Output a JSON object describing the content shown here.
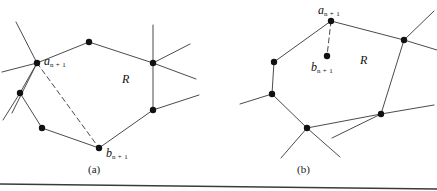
{
  "figure": {
    "background": "#ffffff",
    "edge_color": "#4a4a52",
    "vertex_color": "#111111",
    "label_color": "#111111",
    "rule_color": "#3a3a3a"
  },
  "panels": [
    {
      "id": "a",
      "caption": "(a)",
      "region_label": "R",
      "point_labels": {
        "a": {
          "base": "a",
          "sub": "n + 1"
        },
        "b": {
          "base": "b",
          "sub": "n + 1"
        }
      },
      "vertices": [
        {
          "name": "a-n-plus-1",
          "x": 37,
          "y": 63
        },
        {
          "name": "top",
          "x": 89,
          "y": 42
        },
        {
          "name": "right-upper",
          "x": 153,
          "y": 63
        },
        {
          "name": "right-lower",
          "x": 153,
          "y": 110
        },
        {
          "name": "b-n-plus-1",
          "x": 99,
          "y": 148
        },
        {
          "name": "lower-left-inner",
          "x": 42,
          "y": 128
        },
        {
          "name": "left-mid",
          "x": 20,
          "y": 93
        }
      ],
      "solid_edges": [
        [
          37,
          63,
          89,
          42
        ],
        [
          89,
          42,
          153,
          63
        ],
        [
          153,
          63,
          153,
          110
        ],
        [
          153,
          110,
          99,
          148
        ],
        [
          99,
          148,
          42,
          128
        ],
        [
          42,
          128,
          20,
          93
        ],
        [
          20,
          93,
          37,
          63
        ]
      ],
      "stub_edges": [
        [
          37,
          63,
          16,
          22
        ],
        [
          37,
          63,
          2,
          72
        ],
        [
          37,
          63,
          12,
          113
        ],
        [
          153,
          63,
          190,
          44
        ],
        [
          153,
          63,
          196,
          79
        ],
        [
          153,
          63,
          153,
          25
        ],
        [
          153,
          110,
          199,
          95
        ],
        [
          20,
          93,
          3,
          120
        ]
      ],
      "dashed_edges": [
        [
          37,
          63,
          99,
          148
        ]
      ]
    },
    {
      "id": "b",
      "caption": "(b)",
      "region_label": "R",
      "point_labels": {
        "a": {
          "base": "a",
          "sub": "n + 1"
        },
        "b": {
          "base": "b",
          "sub": "n + 1"
        }
      },
      "vertices": [
        {
          "name": "a-n-plus-1",
          "x": 331,
          "y": 21
        },
        {
          "name": "b-n-plus-1",
          "x": 327,
          "y": 56
        },
        {
          "name": "right-upper",
          "x": 404,
          "y": 40
        },
        {
          "name": "right-lower",
          "x": 381,
          "y": 114
        },
        {
          "name": "bottom",
          "x": 307,
          "y": 128
        },
        {
          "name": "left-lower",
          "x": 272,
          "y": 94
        },
        {
          "name": "left-upper",
          "x": 274,
          "y": 62
        }
      ],
      "solid_edges": [
        [
          331,
          21,
          404,
          40
        ],
        [
          404,
          40,
          381,
          114
        ],
        [
          381,
          114,
          307,
          128
        ],
        [
          307,
          128,
          272,
          94
        ],
        [
          272,
          94,
          274,
          62
        ],
        [
          274,
          62,
          331,
          21
        ]
      ],
      "stub_edges": [
        [
          404,
          40,
          434,
          11
        ],
        [
          404,
          40,
          437,
          50
        ],
        [
          381,
          114,
          434,
          105
        ],
        [
          381,
          114,
          332,
          138
        ],
        [
          307,
          128,
          340,
          157
        ],
        [
          307,
          128,
          281,
          158
        ],
        [
          272,
          94,
          240,
          104
        ]
      ],
      "dashed_edges": [
        [
          331,
          21,
          327,
          56
        ]
      ]
    }
  ],
  "divider": {
    "name": "bottom-rule",
    "x1": 0,
    "y1": 184,
    "x2": 437,
    "y2": 189
  }
}
